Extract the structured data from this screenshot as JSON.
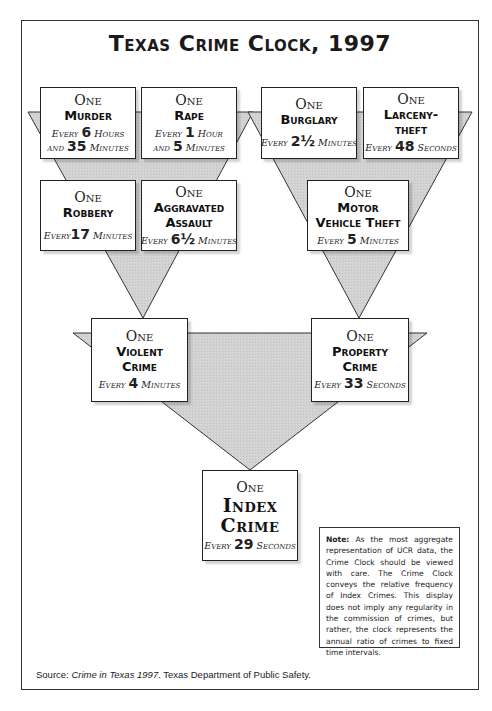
{
  "title": "Texas Crime Clock, 1997",
  "one_label": "One",
  "nodes": {
    "murder": {
      "name": "Murder",
      "freq_prefix": "Every",
      "freq_value": "6",
      "freq_unit": "Hours",
      "freq_line2_prefix": "and",
      "freq_line2_value": "35",
      "freq_line2_unit": "Minutes"
    },
    "rape": {
      "name": "Rape",
      "freq_prefix": "Every",
      "freq_value": "1",
      "freq_unit": "Hour",
      "freq_line2_prefix": "and",
      "freq_line2_value": "5",
      "freq_line2_unit": "Minutes"
    },
    "burglary": {
      "name": "Burglary",
      "freq_prefix": "Every",
      "freq_value": "2½",
      "freq_unit": "Minutes"
    },
    "larceny": {
      "name": "Larceny-\ntheft",
      "freq_prefix": "Every",
      "freq_value": "48",
      "freq_unit": "Seconds"
    },
    "robbery": {
      "name": "Robbery",
      "freq_prefix": "Every",
      "freq_value": "17",
      "freq_unit": "Minutes"
    },
    "aggravated_assault": {
      "name": "Aggravated\nAssault",
      "freq_prefix": "Every",
      "freq_value": "6½",
      "freq_unit": "Minutes"
    },
    "motor_vehicle_theft": {
      "name": "Motor\nVehicle Theft",
      "freq_prefix": "Every",
      "freq_value": "5",
      "freq_unit": "Minutes"
    },
    "violent_crime": {
      "name": "Violent\nCrime",
      "freq_prefix": "Every",
      "freq_value": "4",
      "freq_unit": "Minutes"
    },
    "property_crime": {
      "name": "Property\nCrime",
      "freq_prefix": "Every",
      "freq_value": "33",
      "freq_unit": "Seconds"
    },
    "index_crime": {
      "name": "Index\nCrime",
      "freq_prefix": "Every",
      "freq_value": "29",
      "freq_unit": "Seconds"
    }
  },
  "note": {
    "label": "Note:",
    "text": "As the most aggregate representation of UCR data, the Crime Clock should be viewed with care. The Crime Clock conveys the relative frequency of Index Crimes. This display does not imply any regularity in the commission of crimes, but rather, the clock represents the annual ratio of crimes to fixed time intervals."
  },
  "source": {
    "label": "Source:",
    "publication": "Crime in Texas 1997",
    "publisher": ". Texas Department of Public Safety."
  },
  "colors": {
    "funnel_fill": "#d4d4d4",
    "border": "#222222",
    "background": "#ffffff"
  }
}
